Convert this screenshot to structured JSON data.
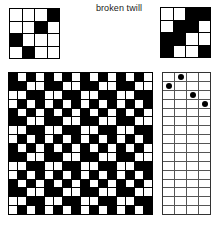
{
  "title": "broken twill",
  "colors": {
    "ink": "#000000",
    "paper": "#ffffff",
    "grid_line": "#333333",
    "text": "#1a1a1a"
  },
  "threading": {
    "name": "threading-draft",
    "columns": 4,
    "rows": 4,
    "cells": [
      [
        0,
        0,
        0,
        1
      ],
      [
        0,
        0,
        1,
        0
      ],
      [
        1,
        0,
        0,
        0
      ],
      [
        0,
        1,
        0,
        0
      ]
    ]
  },
  "tieup": {
    "name": "tie-up-draft",
    "columns": 4,
    "rows": 4,
    "cells": [
      [
        0,
        0,
        1,
        1
      ],
      [
        0,
        1,
        1,
        0
      ],
      [
        1,
        1,
        0,
        0
      ],
      [
        1,
        0,
        0,
        1
      ]
    ]
  },
  "treadling": {
    "name": "treadling-draft",
    "columns": 4,
    "rows": 16,
    "marker": "dot",
    "cells": [
      [
        0,
        1,
        0,
        0
      ],
      [
        1,
        0,
        0,
        0
      ],
      [
        0,
        0,
        1,
        0
      ],
      [
        0,
        0,
        0,
        1
      ],
      [
        0,
        0,
        0,
        0
      ],
      [
        0,
        0,
        0,
        0
      ],
      [
        0,
        0,
        0,
        0
      ],
      [
        0,
        0,
        0,
        0
      ],
      [
        0,
        0,
        0,
        0
      ],
      [
        0,
        0,
        0,
        0
      ],
      [
        0,
        0,
        0,
        0
      ],
      [
        0,
        0,
        0,
        0
      ],
      [
        0,
        0,
        0,
        0
      ],
      [
        0,
        0,
        0,
        0
      ],
      [
        0,
        0,
        0,
        0
      ],
      [
        0,
        0,
        0,
        0
      ]
    ]
  },
  "drawdown": {
    "name": "drawdown-fabric-grid",
    "columns": 16,
    "rows": 16,
    "cells": [
      [
        1,
        0,
        1,
        0,
        1,
        0,
        1,
        0,
        1,
        0,
        1,
        0,
        1,
        0,
        1,
        0
      ],
      [
        1,
        1,
        0,
        0,
        1,
        1,
        0,
        0,
        1,
        1,
        0,
        0,
        1,
        1,
        0,
        0
      ],
      [
        0,
        0,
        1,
        1,
        0,
        0,
        1,
        1,
        0,
        0,
        1,
        1,
        0,
        0,
        1,
        1
      ],
      [
        0,
        1,
        0,
        1,
        0,
        1,
        0,
        1,
        0,
        1,
        0,
        1,
        0,
        1,
        0,
        1
      ],
      [
        1,
        0,
        1,
        0,
        1,
        0,
        1,
        0,
        1,
        0,
        1,
        0,
        1,
        0,
        1,
        0
      ],
      [
        1,
        1,
        0,
        0,
        1,
        1,
        0,
        0,
        1,
        1,
        0,
        0,
        1,
        1,
        0,
        0
      ],
      [
        0,
        0,
        1,
        1,
        0,
        0,
        1,
        1,
        0,
        0,
        1,
        1,
        0,
        0,
        1,
        1
      ],
      [
        0,
        1,
        0,
        1,
        0,
        1,
        0,
        1,
        0,
        1,
        0,
        1,
        0,
        1,
        0,
        1
      ],
      [
        1,
        0,
        1,
        0,
        1,
        0,
        1,
        0,
        1,
        0,
        1,
        0,
        1,
        0,
        1,
        0
      ],
      [
        1,
        1,
        0,
        0,
        1,
        1,
        0,
        0,
        1,
        1,
        0,
        0,
        1,
        1,
        0,
        0
      ],
      [
        0,
        0,
        1,
        1,
        0,
        0,
        1,
        1,
        0,
        0,
        1,
        1,
        0,
        0,
        1,
        1
      ],
      [
        0,
        1,
        0,
        1,
        0,
        1,
        0,
        1,
        0,
        1,
        0,
        1,
        0,
        1,
        0,
        1
      ],
      [
        1,
        0,
        1,
        0,
        1,
        0,
        1,
        0,
        1,
        0,
        1,
        0,
        1,
        0,
        1,
        0
      ],
      [
        1,
        1,
        0,
        0,
        1,
        1,
        0,
        0,
        1,
        1,
        0,
        0,
        1,
        1,
        0,
        0
      ],
      [
        0,
        0,
        1,
        1,
        0,
        0,
        1,
        1,
        0,
        0,
        1,
        1,
        0,
        0,
        1,
        1
      ],
      [
        0,
        1,
        0,
        1,
        0,
        1,
        0,
        1,
        0,
        1,
        0,
        1,
        0,
        1,
        0,
        1
      ]
    ]
  }
}
